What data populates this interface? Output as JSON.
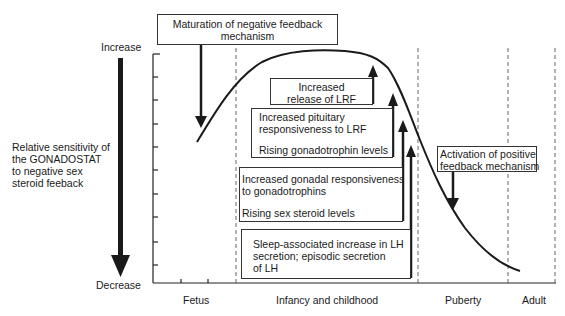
{
  "diagram": {
    "y_axis": {
      "top_label": "Increase",
      "bottom_label": "Decrease",
      "title_lines": [
        "Relative sensitivity of",
        "the GONADOSTAT",
        "to negative sex",
        "steroid feeback"
      ]
    },
    "x_axis": {
      "phases": [
        "Fetus",
        "Infancy and childhood",
        "Puberty",
        "Adult"
      ]
    },
    "boxes": {
      "maturation": {
        "lines": [
          "Maturation of negative feedback",
          "mechanism"
        ]
      },
      "lrf_release": {
        "lines": [
          "Increased",
          "release of LRF"
        ]
      },
      "pituitary": {
        "lines": [
          "Increased pituitary",
          "responsiveness to LRF",
          "Rising gonadotrophin levels"
        ]
      },
      "gonadal": {
        "lines": [
          "Increased gonadal responsiveness",
          "to gonadotrophins",
          "Rising sex steroid levels"
        ]
      },
      "sleep_lh": {
        "lines": [
          "Sleep-associated increase in LH",
          "secretion; episodic secretion",
          "of LH"
        ]
      },
      "positive_feedback": {
        "lines": [
          "Activation of positive",
          "feedback mechanism"
        ]
      }
    },
    "colors": {
      "ink": "#1a1a1a",
      "line": "#222222",
      "dash": "#555555",
      "background": "#ffffff"
    }
  }
}
